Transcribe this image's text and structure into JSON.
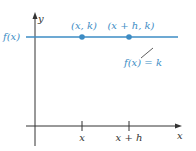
{
  "diagram": {
    "colors": {
      "line": "#3d8cc4",
      "axis": "#333333",
      "label_blue": "#3d8cc4",
      "label_dark": "#333333",
      "background": "#ffffff"
    },
    "axes": {
      "y_label": "y",
      "x_label": "x"
    },
    "horizontal_line": {
      "left_label": "f(x)",
      "equation_label": "f(x) = k"
    },
    "points": [
      {
        "label": "(x, k)"
      },
      {
        "label": "(x + h, k)"
      }
    ],
    "ticks": [
      {
        "label": "x"
      },
      {
        "label": "x + h"
      }
    ]
  }
}
